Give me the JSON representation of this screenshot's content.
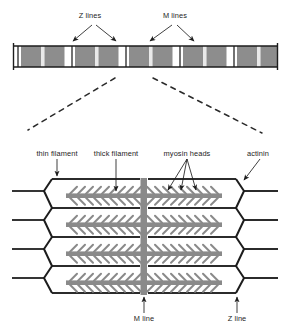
{
  "figure": {
    "background": "#ffffff",
    "ink": "#1d1d1d"
  },
  "colors": {
    "outline": "#1d1d1d",
    "a_band_dark": "#8d8d8d",
    "a_band_mid": "#9b9b9b",
    "i_band_light": "#ffffff",
    "filament_gray": "#8a8a8a",
    "thin_filament": "#2b2b2b",
    "dashed_guide": "#2b2b2b"
  },
  "top_view": {
    "name": "myofibril-band-strip",
    "labels": [
      {
        "id": "z-lines",
        "text": "Z lines",
        "x": 90,
        "y": 14,
        "arrow_targets": [
          72,
          117
        ]
      },
      {
        "id": "m-lines",
        "text": "M lines",
        "x": 175,
        "y": 14,
        "arrow_targets": [
          148,
          193
        ]
      }
    ],
    "strip": {
      "x": 13,
      "y": 44,
      "width": 265,
      "height": 24,
      "sarcomere_count": 6,
      "band_sequence": [
        "I",
        "A",
        "M",
        "A",
        "I",
        "Z"
      ]
    }
  },
  "magnifier": {
    "name": "magnification-guides",
    "lines": [
      {
        "x1": 115,
        "y1": 78,
        "x2": 28,
        "y2": 130
      },
      {
        "x1": 153,
        "y1": 78,
        "x2": 262,
        "y2": 133
      }
    ]
  },
  "detail_view": {
    "name": "sarcomere-detail",
    "callouts": [
      {
        "id": "thin-filament",
        "text": "thin filament",
        "x": 57,
        "y": 150,
        "pointer": "down"
      },
      {
        "id": "thick-filament",
        "text": "thick filament",
        "x": 116,
        "y": 150,
        "pointer": "down"
      },
      {
        "id": "myosin-heads",
        "text": "myosin heads",
        "x": 187,
        "y": 150,
        "pointer": "fan"
      },
      {
        "id": "actinin",
        "text": "actinin",
        "x": 256,
        "y": 150,
        "pointer": "diagonal"
      }
    ],
    "bottom_callouts": [
      {
        "id": "m-line",
        "text": "M line",
        "x": 144,
        "y": 318,
        "pointer": "up"
      },
      {
        "id": "z-line",
        "text": "Z line",
        "x": 237,
        "y": 318,
        "pointer": "up"
      }
    ],
    "lattice": {
      "thin_filament_rows": 5,
      "thick_filament_rows": 4,
      "m_line_x": 144,
      "left_z_x": 44,
      "right_z_x": 243,
      "top_y": 176,
      "bottom_y": 295,
      "myosin_heads_per_side": 9
    }
  }
}
